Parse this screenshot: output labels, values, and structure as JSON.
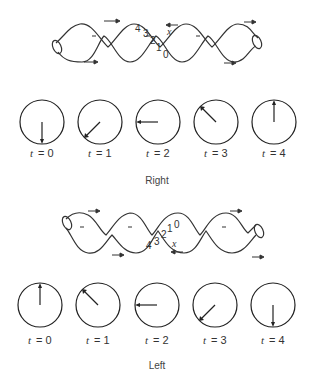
{
  "panels": [
    {
      "id": "right",
      "caption": "Right",
      "helix": {
        "numbers": [
          "4",
          "3",
          "2",
          "1",
          "0"
        ],
        "variable": "x",
        "arrow_direction_marker": "left"
      },
      "clocks": [
        {
          "label_var": "t",
          "label_eq": "= 0",
          "hand_angle_deg": 180
        },
        {
          "label_var": "t",
          "label_eq": "= 1",
          "hand_angle_deg": 225
        },
        {
          "label_var": "t",
          "label_eq": "= 2",
          "hand_angle_deg": 270
        },
        {
          "label_var": "t",
          "label_eq": "= 3",
          "hand_angle_deg": 315
        },
        {
          "label_var": "t",
          "label_eq": "= 4",
          "hand_angle_deg": 0
        }
      ]
    },
    {
      "id": "left",
      "caption": "Left",
      "helix": {
        "numbers": [
          "4",
          "3",
          "2",
          "1",
          "0"
        ],
        "variable": "x",
        "arrow_direction_marker": "left"
      },
      "clocks": [
        {
          "label_var": "t",
          "label_eq": "= 0",
          "hand_angle_deg": 0
        },
        {
          "label_var": "t",
          "label_eq": "= 1",
          "hand_angle_deg": 315
        },
        {
          "label_var": "t",
          "label_eq": "= 2",
          "hand_angle_deg": 270
        },
        {
          "label_var": "t",
          "label_eq": "= 3",
          "hand_angle_deg": 225
        },
        {
          "label_var": "t",
          "label_eq": "= 4",
          "hand_angle_deg": 180
        }
      ]
    }
  ]
}
